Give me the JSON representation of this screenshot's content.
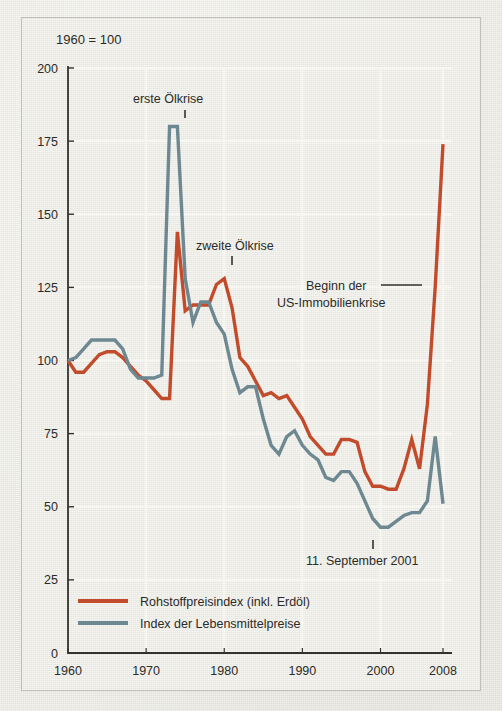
{
  "figure": {
    "header_note": "1960 = 100",
    "background_color": "#ecebe3",
    "axis_color": "#33322e",
    "text_color": "#2b2b28",
    "gridline_color": "#f7f6f1"
  },
  "chart_data": {
    "type": "line",
    "title": "",
    "subtitle": "",
    "header_note": "1960 = 100",
    "xlabel": "",
    "ylabel": "",
    "xlim": [
      1960,
      2008
    ],
    "ylim": [
      0,
      200
    ],
    "xticks": [
      1960,
      1970,
      1980,
      1990,
      2000,
      2008
    ],
    "xtick_labels": [
      "1960",
      "1970",
      "1980",
      "1990",
      "2000",
      "2008"
    ],
    "yticks": [
      0,
      25,
      50,
      75,
      100,
      125,
      150,
      175,
      200
    ],
    "ytick_labels": [
      "0",
      "25",
      "50",
      "75",
      "100",
      "125",
      "150",
      "175",
      "200"
    ],
    "grid": true,
    "legend_position": "bottom-left",
    "x": [
      1960,
      1961,
      1962,
      1963,
      1964,
      1965,
      1966,
      1967,
      1968,
      1969,
      1970,
      1971,
      1972,
      1973,
      1974,
      1975,
      1976,
      1977,
      1978,
      1979,
      1980,
      1981,
      1982,
      1983,
      1984,
      1985,
      1986,
      1987,
      1988,
      1989,
      1990,
      1991,
      1992,
      1993,
      1994,
      1995,
      1996,
      1997,
      1998,
      1999,
      2000,
      2001,
      2002,
      2003,
      2004,
      2005,
      2006,
      2007,
      2008
    ],
    "series": [
      {
        "name": "Rohstoffpreisindex (inkl. Erdöl)",
        "color": "#C24B2C",
        "values": [
          100,
          96,
          96,
          99,
          102,
          103,
          103,
          101,
          98,
          95,
          93,
          90,
          87,
          87,
          144,
          117,
          119,
          119,
          119,
          126,
          128,
          118,
          101,
          98,
          93,
          88,
          89,
          87,
          88,
          84,
          80,
          74,
          71,
          68,
          68,
          73,
          73,
          72,
          62,
          57,
          57,
          56,
          56,
          63,
          73,
          63,
          85,
          125,
          174
        ]
      },
      {
        "name": "Index der Lebensmittelpreise",
        "color": "#6E8892",
        "values": [
          100,
          101,
          104,
          107,
          107,
          107,
          107,
          104,
          97,
          94,
          94,
          94,
          95,
          180,
          180,
          128,
          113,
          120,
          120,
          113,
          109,
          97,
          89,
          91,
          91,
          80,
          71,
          68,
          74,
          76,
          71,
          68,
          66,
          60,
          59,
          62,
          62,
          58,
          52,
          46,
          43,
          43,
          45,
          47,
          48,
          48,
          52,
          74,
          51
        ]
      }
    ],
    "annotations": [
      {
        "name": "erste-oelkrise",
        "text": "erste Ölkrise",
        "x": 1973,
        "y": 191
      },
      {
        "name": "zweite-oelkrise",
        "text": "zweite Ölkrise",
        "x": 1980,
        "y": 140
      },
      {
        "name": "beginn-us-immobilienkrise",
        "text": "Beginn der\nUS-Immobilienkrise",
        "x": 2007,
        "y": 125
      },
      {
        "name": "elfter-september",
        "text": "11. September 2001",
        "x": 2001,
        "y": 35
      }
    ],
    "annotation_lines": [
      {
        "name": "erste-oelkrise-tick",
        "text": "erste Ölkrise"
      },
      {
        "name": "zweite-oelkrise-tick",
        "text": "zweite Ölkrise"
      },
      {
        "name": "us-immobilienkrise-leader",
        "text": "Beginn der US-Immobilienkrise"
      },
      {
        "name": "september-2001-tick",
        "text": "11. September 2001"
      }
    ]
  },
  "annotations": {
    "erste_oelkrise": "erste Ölkrise",
    "zweite_oelkrise": "zweite Ölkrise",
    "us_immobilienkrise_line1": "Beginn der",
    "us_immobilienkrise_line2": "US-Immobilienkrise",
    "september_2001": "11. September 2001"
  },
  "legend": {
    "items": [
      {
        "label": "Rohstoffpreisindex (inkl. Erdöl)",
        "color": "#C24B2C"
      },
      {
        "label": "Index der Lebensmittelpreise",
        "color": "#6E8892"
      }
    ]
  }
}
